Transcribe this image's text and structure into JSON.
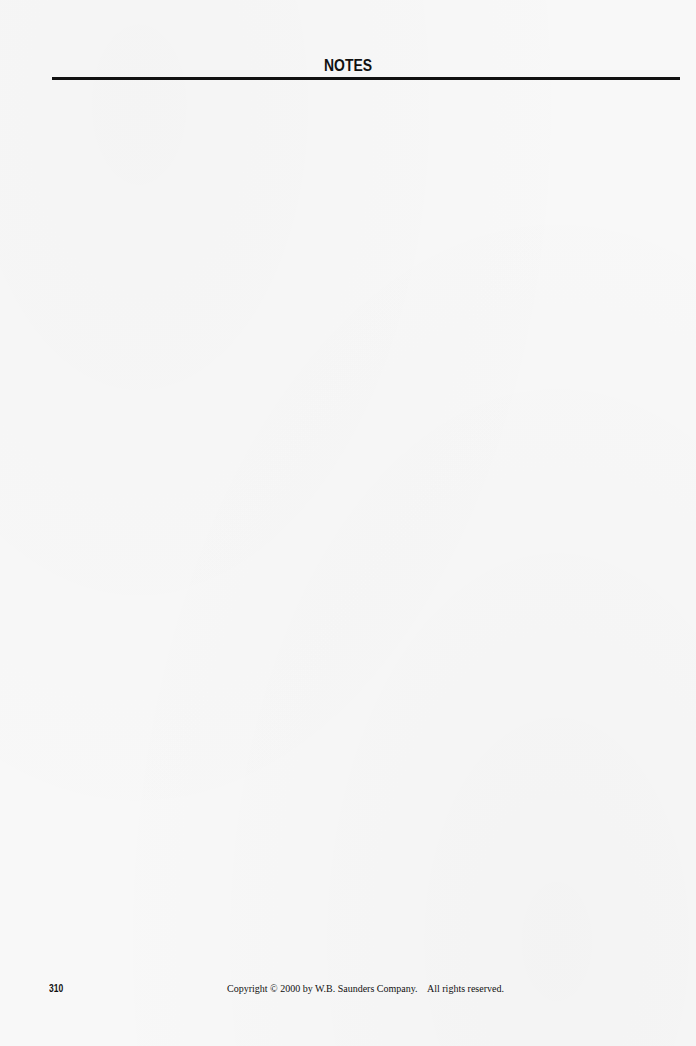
{
  "header": {
    "title": "NOTES"
  },
  "notes": {
    "content": ""
  },
  "footer": {
    "page_number": "310",
    "copyright": "Copyright © 2000 by W.B. Saunders Company.    All rights reserved."
  },
  "colors": {
    "background": "#f8f8f8",
    "text": "#111111",
    "rule": "#111111"
  }
}
